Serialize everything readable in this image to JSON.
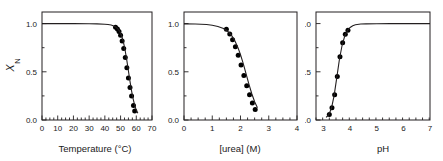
{
  "figure": {
    "title": "",
    "background_color": "#ffffff",
    "marker_color": "#000000",
    "line_color": "#231f20",
    "panel_count": 3
  },
  "ylabel": {
    "main": "X",
    "sub": "N",
    "full": "X_N"
  },
  "chart_data": [
    {
      "type": "scatter",
      "title": "",
      "xlabel": "Temperature (°C)",
      "ylabel": "X_N",
      "xlim": [
        0,
        70
      ],
      "ylim": [
        0.0,
        1.12
      ],
      "xticks": [
        0,
        10,
        20,
        30,
        40,
        50,
        60,
        70
      ],
      "xticklabels": [
        "0",
        "10",
        "20",
        "30",
        "40",
        "50",
        "60",
        "70"
      ],
      "yticks": [
        0.0,
        0.5,
        1.0
      ],
      "yticklabels": [
        "0.0",
        "0.5",
        "1.0"
      ],
      "minor_xtick_step": 2.5,
      "grid": false,
      "legend": "none",
      "series": [
        {
          "name": "thermal denaturation data",
          "marker": "filled-circle",
          "x": [
            46.8,
            48.0,
            49.0,
            50.0,
            51.0,
            52.0,
            53.0,
            54.0,
            55.0,
            56.0,
            57.0,
            58.2,
            59.0
          ],
          "y": [
            0.962,
            0.944,
            0.918,
            0.878,
            0.82,
            0.742,
            0.648,
            0.542,
            0.436,
            0.336,
            0.248,
            0.15,
            0.093
          ]
        },
        {
          "name": "fitted two-state curve",
          "marker": "line",
          "x": [
            0,
            10,
            20,
            30,
            35,
            40,
            42,
            44,
            46,
            47,
            48,
            49,
            50,
            51,
            52,
            53,
            54,
            55,
            56,
            57,
            58,
            59,
            60,
            61
          ],
          "y": [
            0.999,
            0.999,
            0.999,
            0.998,
            0.997,
            0.993,
            0.99,
            0.985,
            0.973,
            0.964,
            0.95,
            0.93,
            0.9,
            0.856,
            0.794,
            0.713,
            0.615,
            0.508,
            0.4,
            0.302,
            0.218,
            0.152,
            0.103,
            0.069
          ]
        }
      ]
    },
    {
      "type": "scatter",
      "title": "",
      "xlabel": "[urea] (M)",
      "ylabel": "X_N",
      "xlim": [
        0,
        4
      ],
      "ylim": [
        0.0,
        1.12
      ],
      "xticks": [
        0,
        1,
        2,
        3,
        4
      ],
      "xticklabels": [
        "0",
        "1",
        "2",
        "3",
        "4"
      ],
      "yticks": [
        0.0,
        0.5,
        1.0
      ],
      "yticklabels": [
        "0.0",
        "0.5",
        "1.0"
      ],
      "minor_xtick_step": 0.25,
      "grid": false,
      "legend": "none",
      "series": [
        {
          "name": "urea denaturation data",
          "marker": "filled-circle",
          "x": [
            1.5,
            1.62,
            1.72,
            1.82,
            1.92,
            2.02,
            2.12,
            2.22,
            2.32,
            2.42,
            2.52
          ],
          "y": [
            0.94,
            0.892,
            0.832,
            0.76,
            0.672,
            0.57,
            0.462,
            0.356,
            0.262,
            0.176,
            0.108
          ]
        },
        {
          "name": "fitted two-state curve",
          "marker": "line",
          "x": [
            0.0,
            0.4,
            0.8,
            1.0,
            1.2,
            1.4,
            1.5,
            1.6,
            1.7,
            1.8,
            1.9,
            2.0,
            2.1,
            2.2,
            2.3,
            2.4,
            2.5,
            2.6
          ],
          "y": [
            0.997,
            0.996,
            0.99,
            0.983,
            0.97,
            0.948,
            0.93,
            0.905,
            0.87,
            0.822,
            0.758,
            0.678,
            0.582,
            0.476,
            0.37,
            0.272,
            0.19,
            0.126
          ]
        }
      ]
    },
    {
      "type": "scatter",
      "title": "",
      "xlabel": "pH",
      "ylabel": "X_N",
      "xlim": [
        2.72,
        7.0
      ],
      "ylim": [
        0.0,
        1.12
      ],
      "xticks": [
        3,
        4,
        5,
        6,
        7
      ],
      "xticklabels": [
        "3",
        "4",
        "5",
        "6",
        "7"
      ],
      "yticks": [
        0.0,
        0.5,
        1.0
      ],
      "yticklabels": [
        "0.0",
        "0.5",
        "1.0"
      ],
      "minor_xtick_step": 0.25,
      "grid": false,
      "legend": "none",
      "series": [
        {
          "name": "pH denaturation data",
          "marker": "filled-circle",
          "x": [
            3.22,
            3.32,
            3.42,
            3.52,
            3.62,
            3.72,
            3.82,
            3.92
          ],
          "y": [
            0.058,
            0.128,
            0.262,
            0.45,
            0.655,
            0.8,
            0.888,
            0.932
          ]
        },
        {
          "name": "fitted two-state curve",
          "marker": "line",
          "x": [
            3.1,
            3.2,
            3.3,
            3.4,
            3.5,
            3.6,
            3.7,
            3.8,
            3.9,
            4.0,
            4.1,
            4.2,
            4.4,
            4.6,
            5.0,
            5.5,
            6.0,
            6.5,
            7.0
          ],
          "y": [
            0.026,
            0.056,
            0.122,
            0.252,
            0.44,
            0.63,
            0.775,
            0.872,
            0.928,
            0.96,
            0.978,
            0.987,
            0.995,
            0.997,
            0.998,
            0.999,
            0.999,
            0.999,
            0.999
          ]
        }
      ]
    }
  ]
}
